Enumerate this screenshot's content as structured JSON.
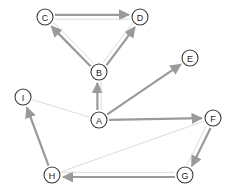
{
  "diagram": {
    "type": "directed-graph",
    "canvas": {
      "width": 231,
      "height": 196,
      "background": "#ffffff"
    },
    "style": {
      "node_fill": "#ffffff",
      "node_stroke": "#3a3a3a",
      "node_radius": 8,
      "label_color": "#1e1e1e",
      "edge_strong_color": "#9a9a9a",
      "edge_faint_color": "#d8d8d8",
      "edge_strong_width": 2.2,
      "edge_faint_width": 0.9,
      "arrow_color_strong": "#9a9a9a",
      "arrow_color_faint": "#d8d8d8"
    },
    "nodes": [
      {
        "id": "C",
        "label": "C",
        "x": 45,
        "y": 17
      },
      {
        "id": "D",
        "label": "D",
        "x": 140,
        "y": 17
      },
      {
        "id": "E",
        "label": "E",
        "x": 190,
        "y": 58
      },
      {
        "id": "B",
        "label": "B",
        "x": 99,
        "y": 72
      },
      {
        "id": "I",
        "label": "I",
        "x": 23,
        "y": 97
      },
      {
        "id": "F",
        "label": "F",
        "x": 213,
        "y": 118
      },
      {
        "id": "A",
        "label": "A",
        "x": 99,
        "y": 120
      },
      {
        "id": "H",
        "label": "H",
        "x": 52,
        "y": 175
      },
      {
        "id": "G",
        "label": "G",
        "x": 185,
        "y": 175
      }
    ],
    "edges": [
      {
        "id": "C-D",
        "from": "C",
        "to": "D",
        "weight": "strong",
        "arrow": true,
        "offset": -2.2
      },
      {
        "id": "D-C",
        "from": "D",
        "to": "C",
        "weight": "faint",
        "arrow": false,
        "offset": -2.2
      },
      {
        "id": "B-C",
        "from": "B",
        "to": "C",
        "weight": "strong",
        "arrow": true,
        "offset": -2.0
      },
      {
        "id": "B-C2",
        "from": "B",
        "to": "C",
        "weight": "faint",
        "arrow": false,
        "offset": 2.4
      },
      {
        "id": "B-D",
        "from": "B",
        "to": "D",
        "weight": "strong",
        "arrow": true,
        "offset": 2.0
      },
      {
        "id": "B-D2",
        "from": "B",
        "to": "D",
        "weight": "faint",
        "arrow": false,
        "offset": -2.4
      },
      {
        "id": "A-B",
        "from": "A",
        "to": "B",
        "weight": "strong",
        "arrow": true,
        "offset": -1.6
      },
      {
        "id": "A-B2",
        "from": "A",
        "to": "B",
        "weight": "faint",
        "arrow": false,
        "offset": 2.2
      },
      {
        "id": "A-E",
        "from": "A",
        "to": "E",
        "weight": "strong",
        "arrow": true,
        "offset": 0
      },
      {
        "id": "A-F",
        "from": "A",
        "to": "F",
        "weight": "strong",
        "arrow": true,
        "offset": 0
      },
      {
        "id": "A-I",
        "from": "A",
        "to": "I",
        "weight": "faint",
        "arrow": false,
        "offset": 0
      },
      {
        "id": "H-I",
        "from": "H",
        "to": "I",
        "weight": "strong",
        "arrow": true,
        "offset": 0
      },
      {
        "id": "G-H",
        "from": "G",
        "to": "H",
        "weight": "strong",
        "arrow": true,
        "offset": -2.0
      },
      {
        "id": "G-H2",
        "from": "G",
        "to": "H",
        "weight": "faint",
        "arrow": false,
        "offset": 2.6
      },
      {
        "id": "F-G",
        "from": "F",
        "to": "G",
        "weight": "strong",
        "arrow": true,
        "offset": -2.2
      },
      {
        "id": "F-G2",
        "from": "F",
        "to": "G",
        "weight": "faint",
        "arrow": false,
        "offset": 2.6
      },
      {
        "id": "H-F",
        "from": "H",
        "to": "F",
        "weight": "faint",
        "arrow": false,
        "offset": 0
      }
    ]
  }
}
